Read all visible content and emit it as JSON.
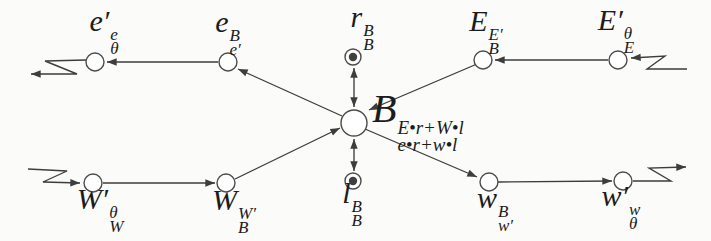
{
  "figure": {
    "type": "node-link diagram",
    "colors": {
      "ink": "#3d3d3d",
      "label_ink": "#1c1c1c",
      "node_fill": "#ffffff",
      "dot_fill": "#3f3f3f",
      "background": "#fbfbf9"
    },
    "nodes": [
      {
        "id": "e-prime",
        "kind": "plain-circle",
        "label": {
          "base": "e′",
          "sup": "e",
          "sub": "θ"
        }
      },
      {
        "id": "e",
        "kind": "plain-circle",
        "label": {
          "base": "e",
          "sup": "B",
          "sub": "e′"
        }
      },
      {
        "id": "r",
        "kind": "ringed-dot",
        "label": {
          "base": "r",
          "sup": "B",
          "sub": "B"
        }
      },
      {
        "id": "E",
        "kind": "plain-circle",
        "label": {
          "base": "E",
          "sup": "E′",
          "sub": "B"
        }
      },
      {
        "id": "E-prime",
        "kind": "plain-circle",
        "label": {
          "base": "E′",
          "sup": "θ",
          "sub": "E"
        }
      },
      {
        "id": "B",
        "kind": "center-circle",
        "label": {
          "base": "B",
          "sup": "E•r+W•l",
          "sub": "e•r+w•l"
        }
      },
      {
        "id": "W-prime",
        "kind": "plain-circle",
        "label": {
          "base": "W′",
          "sup": "θ",
          "sub": "W"
        }
      },
      {
        "id": "W",
        "kind": "plain-circle",
        "label": {
          "base": "W",
          "sup": "W′",
          "sub": "B"
        }
      },
      {
        "id": "l",
        "kind": "ringed-dot",
        "label": {
          "base": "l",
          "sup": "B",
          "sub": "B"
        }
      },
      {
        "id": "w",
        "kind": "plain-circle",
        "label": {
          "base": "w",
          "sup": "B",
          "sub": "w′"
        }
      },
      {
        "id": "w-prime",
        "kind": "plain-circle",
        "label": {
          "base": "w′",
          "sup": "w",
          "sub": "θ"
        }
      }
    ],
    "edges": [
      {
        "from": "e",
        "to": "e-prime",
        "arrow": "single"
      },
      {
        "from": "B",
        "to": "e",
        "arrow": "single"
      },
      {
        "from": "E-prime",
        "to": "E",
        "arrow": "single"
      },
      {
        "from": "E",
        "to": "B",
        "arrow": "single"
      },
      {
        "from": "W-prime",
        "to": "W",
        "arrow": "single"
      },
      {
        "from": "W",
        "to": "B",
        "arrow": "single"
      },
      {
        "from": "B",
        "to": "w",
        "arrow": "single"
      },
      {
        "from": "w",
        "to": "w-prime",
        "arrow": "single"
      },
      {
        "from": "B",
        "to": "r",
        "arrow": "double"
      },
      {
        "from": "B",
        "to": "l",
        "arrow": "double"
      },
      {
        "from": "input-zigzag-top-right",
        "to": "E-prime",
        "arrow": "single"
      },
      {
        "from": "input-zigzag-bottom-left",
        "to": "W-prime",
        "arrow": "single"
      },
      {
        "from": "e-prime",
        "to": "output-zigzag-top-left",
        "arrow": "single"
      },
      {
        "from": "w-prime",
        "to": "output-zigzag-bottom-right",
        "arrow": "single"
      }
    ]
  }
}
